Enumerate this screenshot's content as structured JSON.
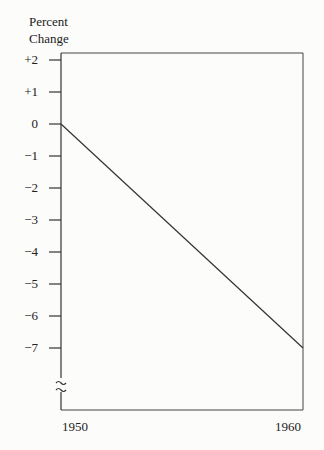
{
  "chart_data": {
    "type": "line",
    "title": "",
    "xlabel": "",
    "ylabel": "Percent Change",
    "ylabel_lines": [
      "Percent",
      "Change"
    ],
    "x": [
      1950,
      1960
    ],
    "x_tick_labels": [
      "1950",
      "1960"
    ],
    "series": [
      {
        "name": "Percent Change",
        "values": [
          0,
          -7
        ]
      }
    ],
    "y_ticks": [
      2,
      1,
      0,
      -1,
      -2,
      -3,
      -4,
      -5,
      -6,
      -7
    ],
    "y_tick_labels": [
      "+2",
      "+1",
      "0",
      "−1",
      "−2",
      "−3",
      "−4",
      "−5",
      "−6",
      "−7"
    ],
    "ylim": [
      -7.8,
      2.3
    ],
    "axis_break": true,
    "grid": false,
    "legend": "none"
  }
}
